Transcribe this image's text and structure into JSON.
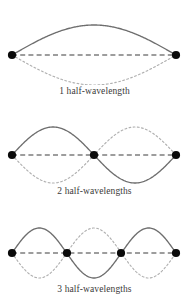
{
  "figure": {
    "background_color": "#ffffff"
  },
  "style": {
    "solid_curve_color": "#6e6e6e",
    "dotted_curve_color": "#b0b0b0",
    "axis_line_color": "#3d3d3d",
    "node_color": "#0a0a0a",
    "caption_color": "#3a3a3a"
  },
  "panels": [
    {
      "id": "harmonic-1",
      "caption": "1 half-wavelength",
      "harmonic_number": 1,
      "node_count": 2,
      "antinode_count": 1,
      "axis_y": 55,
      "amplitude": 30,
      "x_start": 12,
      "x_end": 176,
      "nodes_x": [
        12,
        176
      ]
    },
    {
      "id": "harmonic-2",
      "caption": "2 half-wavelengths",
      "harmonic_number": 2,
      "node_count": 3,
      "antinode_count": 2,
      "axis_y": 55,
      "amplitude": 28,
      "x_start": 12,
      "x_end": 176,
      "nodes_x": [
        12,
        94,
        176
      ]
    },
    {
      "id": "harmonic-3",
      "caption": "3 half-wavelengths",
      "harmonic_number": 3,
      "node_count": 4,
      "antinode_count": 3,
      "axis_y": 53,
      "amplitude": 25,
      "x_start": 12,
      "x_end": 176,
      "nodes_x": [
        12,
        67,
        121,
        176
      ]
    }
  ],
  "chart_data": {
    "type": "line",
    "xlabel": "",
    "ylabel": "",
    "grid": false,
    "legend": "none",
    "xlim": [
      0,
      1
    ],
    "ylim": [
      -1,
      1
    ],
    "series": [
      {
        "name": "1 half-wavelength (solid, positive phase)",
        "harmonic": 1,
        "style": "solid",
        "formula": "y = sin(1*pi*x)",
        "x": [
          0,
          0.125,
          0.25,
          0.375,
          0.5,
          0.625,
          0.75,
          0.875,
          1
        ],
        "values": [
          0,
          0.383,
          0.707,
          0.924,
          1,
          0.924,
          0.707,
          0.383,
          0
        ]
      },
      {
        "name": "1 half-wavelength (dotted, negative phase)",
        "harmonic": 1,
        "style": "dotted",
        "formula": "y = -sin(1*pi*x)",
        "x": [
          0,
          0.125,
          0.25,
          0.375,
          0.5,
          0.625,
          0.75,
          0.875,
          1
        ],
        "values": [
          0,
          -0.383,
          -0.707,
          -0.924,
          -1,
          -0.924,
          -0.707,
          -0.383,
          0
        ]
      },
      {
        "name": "2 half-wavelengths (solid, positive phase)",
        "harmonic": 2,
        "style": "solid",
        "formula": "y = sin(2*pi*x)",
        "x": [
          0,
          0.125,
          0.25,
          0.375,
          0.5,
          0.625,
          0.75,
          0.875,
          1
        ],
        "values": [
          0,
          0.707,
          1,
          0.707,
          0,
          -0.707,
          -1,
          -0.707,
          0
        ]
      },
      {
        "name": "2 half-wavelengths (dotted, negative phase)",
        "harmonic": 2,
        "style": "dotted",
        "formula": "y = -sin(2*pi*x)",
        "x": [
          0,
          0.125,
          0.25,
          0.375,
          0.5,
          0.625,
          0.75,
          0.875,
          1
        ],
        "values": [
          0,
          -0.707,
          -1,
          -0.707,
          0,
          0.707,
          1,
          0.707,
          0
        ]
      },
      {
        "name": "3 half-wavelengths (solid, positive phase)",
        "harmonic": 3,
        "style": "solid",
        "formula": "y = sin(3*pi*x)",
        "x": [
          0,
          0.0833,
          0.1667,
          0.25,
          0.3333,
          0.4167,
          0.5,
          0.5833,
          0.6667,
          0.75,
          0.8333,
          0.9167,
          1
        ],
        "values": [
          0,
          0.707,
          1,
          0.707,
          0,
          -0.707,
          -1,
          -0.707,
          0,
          0.707,
          1,
          0.707,
          0
        ]
      },
      {
        "name": "3 half-wavelengths (dotted, negative phase)",
        "harmonic": 3,
        "style": "dotted",
        "formula": "y = -sin(3*pi*x)",
        "x": [
          0,
          0.0833,
          0.1667,
          0.25,
          0.3333,
          0.4167,
          0.5,
          0.5833,
          0.6667,
          0.75,
          0.8333,
          0.9167,
          1
        ],
        "values": [
          0,
          -0.707,
          -1,
          -0.707,
          0,
          0.707,
          1,
          0.707,
          0,
          -0.707,
          -1,
          -0.707,
          0
        ]
      }
    ],
    "annotations": [
      "1 half-wavelength",
      "2 half-wavelengths",
      "3 half-wavelengths"
    ]
  }
}
